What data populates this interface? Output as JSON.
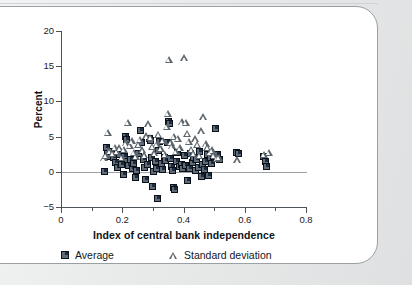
{
  "chart_data": {
    "type": "scatter",
    "title": "",
    "xlabel": "Index of central bank independence",
    "ylabel": "Percent",
    "xlim": [
      0,
      0.8
    ],
    "ylim": [
      -5,
      20
    ],
    "xticks": [
      "0",
      "0.2",
      "0.4",
      "0.6",
      "0.8"
    ],
    "xtick_values": [
      0,
      0.2,
      0.4,
      0.6,
      0.8
    ],
    "xminor_values": [
      0.1,
      0.3,
      0.5,
      0.7
    ],
    "yticks": [
      "20",
      "15",
      "10",
      "5",
      "0",
      "−5"
    ],
    "ytick_values": [
      20,
      15,
      10,
      5,
      0,
      -5
    ],
    "grid": false,
    "zero_line": true,
    "legend_position": "below-axis",
    "series": [
      {
        "name": "Average",
        "marker": "square",
        "color": "#1d2c3e",
        "points": [
          [
            0.142,
            0.1
          ],
          [
            0.148,
            3.4
          ],
          [
            0.152,
            2.6
          ],
          [
            0.158,
            2.2
          ],
          [
            0.165,
            2.9
          ],
          [
            0.172,
            2.0
          ],
          [
            0.178,
            1.3
          ],
          [
            0.185,
            0.6
          ],
          [
            0.192,
            2.4
          ],
          [
            0.198,
            1.0
          ],
          [
            0.205,
            -0.4
          ],
          [
            0.208,
            2.2
          ],
          [
            0.212,
            5.0
          ],
          [
            0.215,
            4.6
          ],
          [
            0.218,
            1.4
          ],
          [
            0.222,
            0.9
          ],
          [
            0.228,
            1.8
          ],
          [
            0.232,
            0.4
          ],
          [
            0.238,
            1.2
          ],
          [
            0.242,
            -0.8
          ],
          [
            0.248,
            0.2
          ],
          [
            0.252,
            2.6
          ],
          [
            0.258,
            5.9
          ],
          [
            0.262,
            4.2
          ],
          [
            0.268,
            1.7
          ],
          [
            0.272,
            0.6
          ],
          [
            0.275,
            -1.1
          ],
          [
            0.282,
            1.1
          ],
          [
            0.288,
            4.8
          ],
          [
            0.292,
            4.4
          ],
          [
            0.295,
            2.1
          ],
          [
            0.298,
            -2.1
          ],
          [
            0.302,
            0.1
          ],
          [
            0.308,
            1.4
          ],
          [
            0.312,
            0.5
          ],
          [
            0.315,
            -3.8
          ],
          [
            0.318,
            3.0
          ],
          [
            0.322,
            4.3
          ],
          [
            0.328,
            1.2
          ],
          [
            0.332,
            0.3
          ],
          [
            0.338,
            2.0
          ],
          [
            0.342,
            1.6
          ],
          [
            0.348,
            4.1
          ],
          [
            0.352,
            7.2
          ],
          [
            0.355,
            6.9
          ],
          [
            0.358,
            1.9
          ],
          [
            0.362,
            0.8
          ],
          [
            0.365,
            0.2
          ],
          [
            0.368,
            -2.3
          ],
          [
            0.372,
            -2.5
          ],
          [
            0.378,
            1.5
          ],
          [
            0.382,
            2.8
          ],
          [
            0.388,
            0.7
          ],
          [
            0.392,
            1.1
          ],
          [
            0.398,
            0.4
          ],
          [
            0.402,
            2.3
          ],
          [
            0.405,
            0.9
          ],
          [
            0.412,
            -1.2
          ],
          [
            0.418,
            0.5
          ],
          [
            0.422,
            2.6
          ],
          [
            0.428,
            1.3
          ],
          [
            0.432,
            2.1
          ],
          [
            0.438,
            0.2
          ],
          [
            0.442,
            1.8
          ],
          [
            0.448,
            0.6
          ],
          [
            0.452,
            2.9
          ],
          [
            0.458,
            -0.6
          ],
          [
            0.462,
            1.0
          ],
          [
            0.468,
            0.3
          ],
          [
            0.472,
            1.4
          ],
          [
            0.478,
            2.4
          ],
          [
            0.482,
            -0.5
          ],
          [
            0.488,
            2.0
          ],
          [
            0.492,
            1.2
          ],
          [
            0.498,
            2.2
          ],
          [
            0.505,
            6.1
          ],
          [
            0.512,
            2.5
          ],
          [
            0.518,
            1.7
          ],
          [
            0.572,
            2.8
          ],
          [
            0.578,
            2.6
          ],
          [
            0.662,
            2.2
          ],
          [
            0.668,
            1.5
          ],
          [
            0.672,
            0.8
          ]
        ]
      },
      {
        "name": "Standard deviation",
        "marker": "triangle",
        "color": "#5d666d",
        "points": [
          [
            0.14,
            2.0
          ],
          [
            0.146,
            2.3
          ],
          [
            0.152,
            5.6
          ],
          [
            0.158,
            3.0
          ],
          [
            0.168,
            2.6
          ],
          [
            0.175,
            3.5
          ],
          [
            0.182,
            2.9
          ],
          [
            0.19,
            3.4
          ],
          [
            0.198,
            2.1
          ],
          [
            0.205,
            3.2
          ],
          [
            0.212,
            4.1
          ],
          [
            0.218,
            7.0
          ],
          [
            0.225,
            3.8
          ],
          [
            0.232,
            4.4
          ],
          [
            0.238,
            2.8
          ],
          [
            0.245,
            2.2
          ],
          [
            0.252,
            3.9
          ],
          [
            0.258,
            4.6
          ],
          [
            0.265,
            3.1
          ],
          [
            0.272,
            2.4
          ],
          [
            0.278,
            5.1
          ],
          [
            0.285,
            6.8
          ],
          [
            0.292,
            4.9
          ],
          [
            0.298,
            3.6
          ],
          [
            0.305,
            2.7
          ],
          [
            0.312,
            4.0
          ],
          [
            0.318,
            5.3
          ],
          [
            0.325,
            3.3
          ],
          [
            0.332,
            4.5
          ],
          [
            0.338,
            2.5
          ],
          [
            0.345,
            6.5
          ],
          [
            0.348,
            8.3
          ],
          [
            0.352,
            16.0
          ],
          [
            0.358,
            4.2
          ],
          [
            0.362,
            3.7
          ],
          [
            0.368,
            5.0
          ],
          [
            0.375,
            2.9
          ],
          [
            0.382,
            4.8
          ],
          [
            0.388,
            3.4
          ],
          [
            0.395,
            7.1
          ],
          [
            0.402,
            16.2
          ],
          [
            0.408,
            7.0
          ],
          [
            0.412,
            5.5
          ],
          [
            0.418,
            4.3
          ],
          [
            0.425,
            3.2
          ],
          [
            0.432,
            2.6
          ],
          [
            0.438,
            4.7
          ],
          [
            0.445,
            3.9
          ],
          [
            0.452,
            2.3
          ],
          [
            0.458,
            5.8
          ],
          [
            0.465,
            7.8
          ],
          [
            0.472,
            4.0
          ],
          [
            0.478,
            3.5
          ],
          [
            0.485,
            2.8
          ],
          [
            0.492,
            3.1
          ],
          [
            0.498,
            2.4
          ],
          [
            0.508,
            1.9
          ],
          [
            0.515,
            2.1
          ],
          [
            0.575,
            1.7
          ],
          [
            0.662,
            2.5
          ],
          [
            0.678,
            2.8
          ]
        ]
      }
    ]
  },
  "legend": {
    "average_label": "Average",
    "stddev_label": "Standard deviation"
  },
  "axes": {
    "x_title": "Index of central bank independence",
    "y_title": "Percent"
  }
}
